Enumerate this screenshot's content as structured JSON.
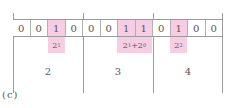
{
  "figure": {
    "caption": "(c)",
    "bits": [
      "0",
      "0",
      "1",
      "0",
      "0",
      "0",
      "1",
      "1",
      "0",
      "1",
      "0",
      "0"
    ],
    "highlighted": [
      false,
      false,
      true,
      false,
      false,
      false,
      true,
      true,
      false,
      true,
      false,
      false
    ],
    "annotations": [
      {
        "base": "2",
        "exp": "1",
        "rest": ""
      },
      {
        "base": "2",
        "exp": "1",
        "rest": "+2",
        "exp2": "0"
      },
      {
        "base": "2",
        "exp": "2",
        "rest": ""
      }
    ],
    "group_values": [
      "2",
      "3",
      "4"
    ],
    "colors": {
      "highlight": "#f7cde3",
      "line": "#9a9a9a",
      "text": "#555555"
    }
  }
}
